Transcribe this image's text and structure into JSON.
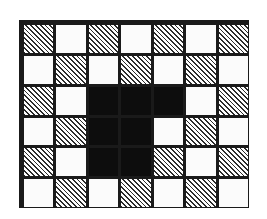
{
  "figure": {
    "columns": 7,
    "rows": 6,
    "fill_types": {
      "hatch": "diagonal-hatched",
      "white": "unshaded-white",
      "black": "solid-black"
    },
    "colors": {
      "border": "#1a1a1a",
      "grid_line": "#1a1a1a",
      "hatch_line": "#2b2b2b",
      "white_fill": "#fbfbfb",
      "black_fill": "#0d0d0d",
      "background": "#ffffff"
    },
    "hatch_angle_degrees": 45,
    "grid": [
      [
        "hatch",
        "white",
        "hatch",
        "white",
        "hatch",
        "white",
        "hatch"
      ],
      [
        "white",
        "hatch",
        "white",
        "hatch",
        "white",
        "hatch",
        "white"
      ],
      [
        "hatch",
        "white",
        "black",
        "black",
        "black",
        "white",
        "hatch"
      ],
      [
        "white",
        "hatch",
        "black",
        "black",
        "white",
        "hatch",
        "white"
      ],
      [
        "hatch",
        "white",
        "black",
        "black",
        "hatch",
        "white",
        "hatch"
      ],
      [
        "white",
        "hatch",
        "white",
        "hatch",
        "white",
        "hatch",
        "white"
      ]
    ]
  }
}
